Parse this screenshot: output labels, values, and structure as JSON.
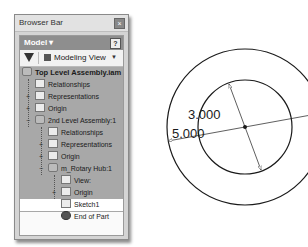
{
  "panel": {
    "title": "Browser Bar",
    "close_icon": "×",
    "model_label": "Model ▾",
    "help_icon": "?",
    "toolbar": {
      "filter_icon": "filter-icon",
      "view_label": "Modeling View",
      "view_arrow": "▼"
    },
    "tree": [
      {
        "label": "Top Level Assembly.iam",
        "level": 0,
        "icon": "assembly",
        "expander": ""
      },
      {
        "label": "Relationships",
        "level": 1,
        "icon": "folder",
        "expander": ""
      },
      {
        "label": "Representations",
        "level": 1,
        "icon": "representations",
        "expander": "+"
      },
      {
        "label": "Origin",
        "level": 1,
        "icon": "folder",
        "expander": "+"
      },
      {
        "label": "2nd Level Assembly:1",
        "level": 1,
        "icon": "assembly",
        "expander": "−"
      },
      {
        "label": "Relationships",
        "level": 2,
        "icon": "folder",
        "expander": ""
      },
      {
        "label": "Representations",
        "level": 2,
        "icon": "representations",
        "expander": "+"
      },
      {
        "label": "Origin",
        "level": 2,
        "icon": "folder",
        "expander": "+"
      },
      {
        "label": "m_Rotary Hub:1",
        "level": 2,
        "icon": "part",
        "expander": "−"
      },
      {
        "label": "View:",
        "level": 3,
        "icon": "view",
        "expander": ""
      },
      {
        "label": "Origin",
        "level": 3,
        "icon": "folder",
        "expander": "+"
      },
      {
        "label": "Sketch1",
        "level": 3,
        "icon": "sketch",
        "expander": "",
        "selected": true
      },
      {
        "label": "End of Part",
        "level": 3,
        "icon": "end",
        "expander": ""
      }
    ]
  },
  "drawing": {
    "inner_diameter": "3.000",
    "outer_diameter": "5.000",
    "center": [
      245,
      127
    ],
    "inner_radius": 47,
    "outer_radius": 78,
    "colors": {
      "stroke": "#1a1a1a"
    }
  }
}
